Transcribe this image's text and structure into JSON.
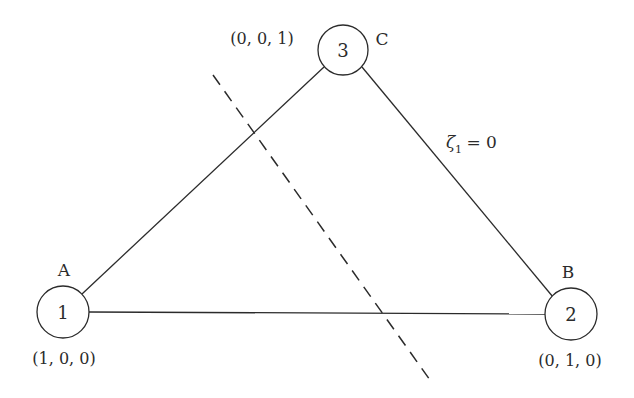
{
  "diagram": {
    "nodes": [
      {
        "id": "1",
        "letter": "A",
        "coords": "(1, 0, 0)",
        "cx": 63,
        "cy": 312
      },
      {
        "id": "2",
        "letter": "B",
        "coords": "(0, 1, 0)",
        "cx": 571,
        "cy": 314
      },
      {
        "id": "3",
        "letter": "C",
        "coords": "(0, 0, 1)",
        "cx": 343,
        "cy": 50
      }
    ],
    "edge_label": {
      "symbol": "ζ",
      "subscript": "1",
      "rest": " = 0"
    },
    "colors": {
      "stroke": "#2b2b2b",
      "background": "#ffffff"
    }
  }
}
